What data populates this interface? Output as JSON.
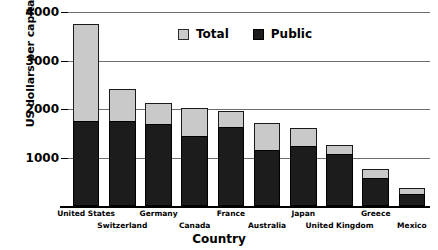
{
  "chart_data": {
    "type": "bar",
    "stacked": true,
    "title": "",
    "xlabel": "Country",
    "ylabel": "US dollars per capita",
    "ylim": [
      0,
      4000
    ],
    "yticks": [
      1000,
      2000,
      3000,
      4000
    ],
    "ytick_labels": [
      "1000",
      "2000",
      "3000",
      "4000"
    ],
    "grid": true,
    "legend_position": "upper center",
    "legend": [
      "Total",
      "Public"
    ],
    "colors": {
      "total": "#c9c9c9",
      "public": "#1c1c1c",
      "axis": "#000000",
      "grid": "#6d6d6d"
    },
    "categories": [
      "United States",
      "Switzerland",
      "Germany",
      "Canada",
      "France",
      "Australia",
      "Japan",
      "United Kingdom",
      "Greece",
      "Mexico"
    ],
    "series": [
      {
        "name": "Total",
        "values": [
          3750,
          2410,
          2120,
          2030,
          1960,
          1720,
          1600,
          1250,
          770,
          380
        ]
      },
      {
        "name": "Public",
        "values": [
          1750,
          1750,
          1690,
          1450,
          1620,
          1150,
          1230,
          1080,
          570,
          250
        ]
      }
    ]
  },
  "axis": {
    "y_title": "US dollars per capita",
    "x_title": "Country"
  }
}
